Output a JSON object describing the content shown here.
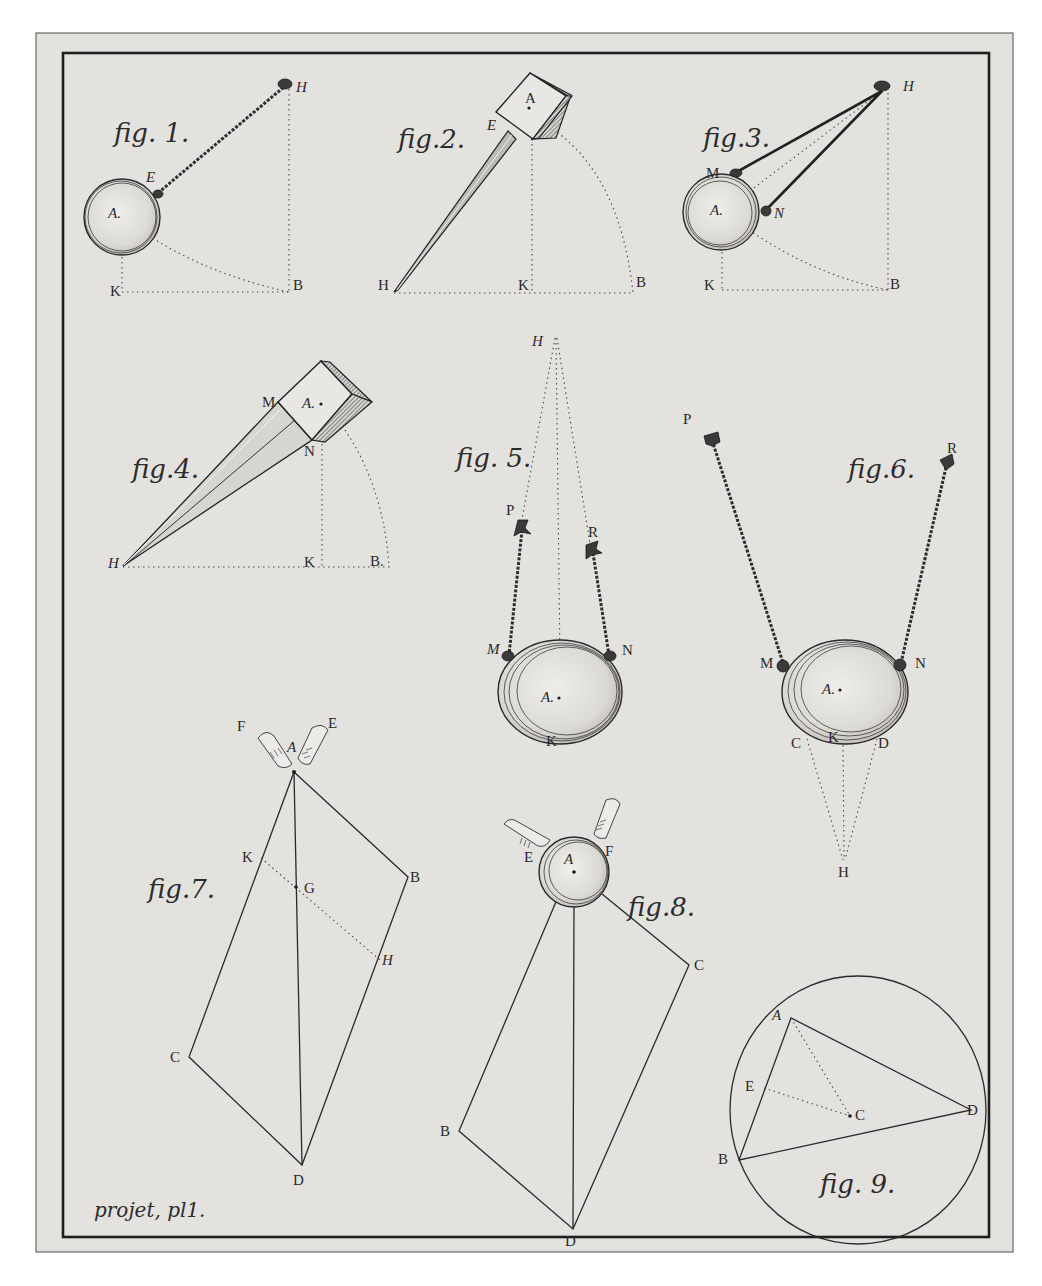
{
  "plate": {
    "caption": "projet, pl1.",
    "colors": {
      "paper": "#e4e2de",
      "ink": "#2a2a2a",
      "background": "#ffffff"
    }
  },
  "figures": [
    {
      "id": "fig1",
      "title": "fig. 1.",
      "subject": "ball pendulum on a rope",
      "labels": {
        "H": "H",
        "E": "E",
        "A": "A.",
        "K": "K",
        "B": "B"
      }
    },
    {
      "id": "fig2",
      "title": "fig.2.",
      "subject": "cube on a rigid rod",
      "labels": {
        "A": "A",
        "E": "E",
        "H": "H",
        "K": "K",
        "B": "B"
      }
    },
    {
      "id": "fig3",
      "title": "fig.3.",
      "subject": "ball suspended by two converging cords",
      "labels": {
        "H": "H",
        "M": "M",
        "N": "N",
        "A": "A.",
        "K": "K",
        "B": "B"
      }
    },
    {
      "id": "fig4",
      "title": "fig.4.",
      "subject": "cube on a tapered prism",
      "labels": {
        "M": "M",
        "A": "A.",
        "N": "N",
        "H": "H",
        "K": "K",
        "B": "B."
      }
    },
    {
      "id": "fig5",
      "title": "fig. 5.",
      "subject": "ball hung from two cords converging upward at H",
      "labels": {
        "H": "H",
        "P": "P",
        "R": "R",
        "M": "M",
        "N": "N",
        "A": "A.",
        "K": "K"
      }
    },
    {
      "id": "fig6",
      "title": "fig.6.",
      "subject": "ball hung from two diverging cords, H below",
      "labels": {
        "P": "P",
        "R": "R",
        "M": "M",
        "N": "N",
        "A": "A.",
        "C": "C",
        "K": "K",
        "D": "D",
        "H": "H"
      }
    },
    {
      "id": "fig7",
      "title": "fig.7.",
      "subject": "parallelogram of forces applied at A by two hands",
      "labels": {
        "F": "F",
        "E": "E",
        "A": "A",
        "K": "K",
        "G": "G",
        "B": "B",
        "H": "H",
        "C": "C",
        "D": "D"
      }
    },
    {
      "id": "fig8",
      "title": "fig.8.",
      "subject": "ball pushed by two hands with parallelogram of forces",
      "labels": {
        "E": "E",
        "A": "A",
        "F": "F",
        "C": "C",
        "B": "B",
        "D": "D"
      }
    },
    {
      "id": "fig9",
      "title": "fig. 9.",
      "subject": "triangle inscribed in circle, center C",
      "labels": {
        "A": "A",
        "E": "E",
        "C": "C",
        "D": "D",
        "B": "B"
      }
    }
  ]
}
